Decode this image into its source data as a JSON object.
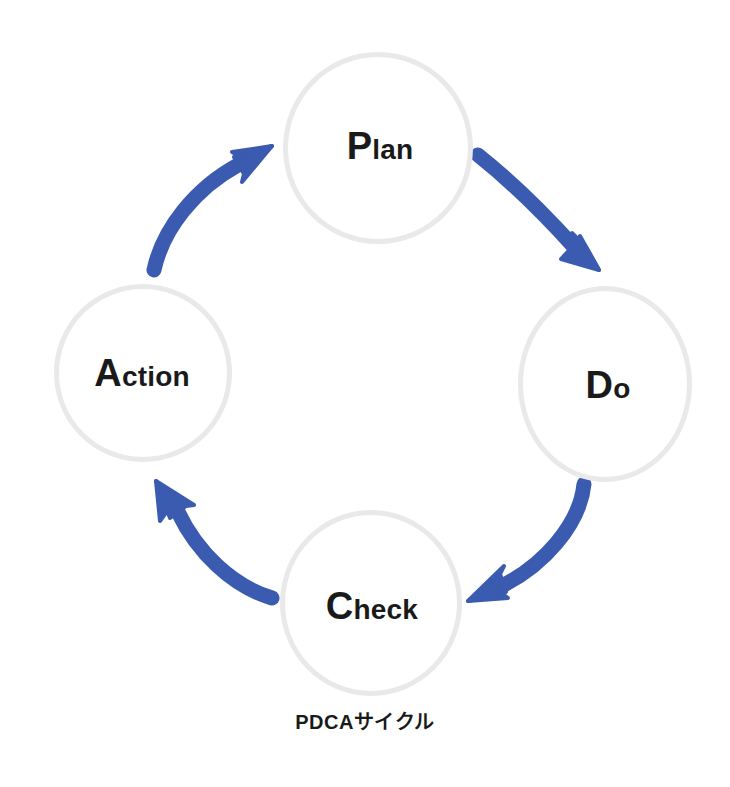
{
  "diagram": {
    "type": "cycle",
    "caption": "PDCAサイクル",
    "background_color": "#ffffff",
    "arrow_color": "#3a5bb0",
    "circle_border_color": "#e9e9e9",
    "text_color": "#1a1a1a",
    "nodes": [
      {
        "id": "plan",
        "cap": "P",
        "rest": "lan",
        "full": "Plan",
        "position": "top"
      },
      {
        "id": "do",
        "cap": "D",
        "rest": "o",
        "full": "Do",
        "position": "right"
      },
      {
        "id": "check",
        "cap": "C",
        "rest": "heck",
        "full": "Check",
        "position": "bottom"
      },
      {
        "id": "action",
        "cap": "A",
        "rest": "ction",
        "full": "Action",
        "position": "left"
      }
    ],
    "arrows": [
      {
        "id": "plan-to-do",
        "from": "Plan",
        "to": "Do",
        "direction": "clockwise"
      },
      {
        "id": "do-to-check",
        "from": "Do",
        "to": "Check",
        "direction": "clockwise"
      },
      {
        "id": "check-to-action",
        "from": "Check",
        "to": "Action",
        "direction": "clockwise"
      },
      {
        "id": "action-to-plan",
        "from": "Action",
        "to": "Plan",
        "direction": "clockwise"
      }
    ]
  }
}
